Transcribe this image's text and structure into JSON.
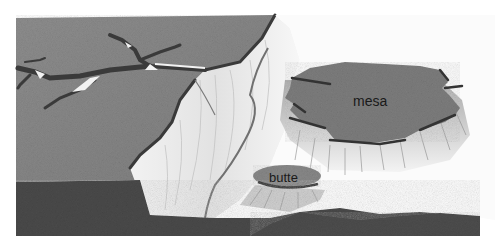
{
  "illustration": {
    "subject": "landforms: plateau, mesa and butte",
    "labels": {
      "mesa": "mesa",
      "butte": "butte"
    },
    "colors": {
      "plateau_top": "#8c8c8c",
      "cliff_face": "#e8e8e8",
      "mesa_top": "#7d7d7d",
      "ground": "#4a4a4a",
      "river": "#707070",
      "background": "#ffffff"
    }
  }
}
